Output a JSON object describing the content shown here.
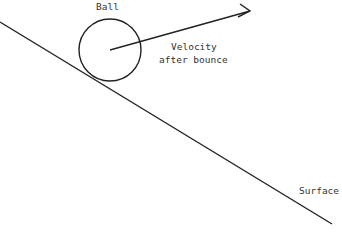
{
  "diagram": {
    "labels": {
      "ball": "Ball",
      "velocity_line1": "Velocity",
      "velocity_line2": "after bounce",
      "surface": "Surface"
    },
    "colors": {
      "stroke": "#222222",
      "text": "#333333",
      "background": "#ffffff"
    },
    "elements": {
      "surface_line": {
        "x1": 0,
        "y1": 22,
        "x2": 332,
        "y2": 224
      },
      "ball_circle": {
        "cx": 110,
        "cy": 50,
        "r": 31
      },
      "velocity_arrow": {
        "x1": 110,
        "y1": 50,
        "x2": 250,
        "y2": 11
      }
    }
  }
}
